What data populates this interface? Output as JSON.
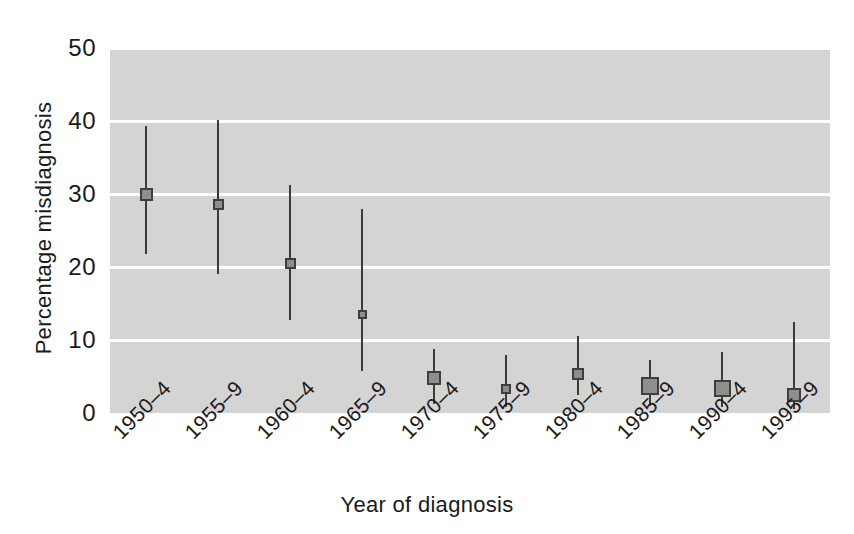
{
  "chart_data": {
    "type": "scatter",
    "title": "",
    "xlabel": "Year of diagnosis",
    "ylabel": "Percentage misdiagnosis",
    "categories": [
      "1950–4",
      "1955–9",
      "1960–4",
      "1965–9",
      "1970–4",
      "1975–9",
      "1980–4",
      "1985–9",
      "1990–4",
      "1995–9"
    ],
    "values": [
      30.0,
      28.5,
      20.5,
      13.5,
      4.8,
      3.3,
      5.3,
      3.7,
      3.3,
      2.5
    ],
    "error_low": [
      21.8,
      19.0,
      12.7,
      5.8,
      1.2,
      0.8,
      2.5,
      1.0,
      0.8,
      0.5
    ],
    "error_high": [
      39.3,
      40.2,
      31.3,
      28.0,
      8.8,
      8.0,
      10.5,
      7.2,
      8.3,
      12.5
    ],
    "marker_sizes": [
      13,
      11,
      11,
      9,
      14,
      10,
      12,
      18,
      17,
      14
    ],
    "ylim": [
      0,
      50
    ],
    "yticks": [
      0,
      10,
      20,
      30,
      40,
      50
    ],
    "ytick_labels": [
      "0",
      "10",
      "20",
      "30",
      "40",
      "50"
    ],
    "gridlines": [
      10,
      20,
      30,
      40,
      50
    ],
    "grid": true,
    "grid_color": "#ffffff",
    "plot_background": "#d4d4d4",
    "marker_fill": "#8e8e8e",
    "marker_edge": "#3e3e3e",
    "whisker_color": "#3b3b3b",
    "legend": null,
    "legend_position": "none",
    "annotations": []
  },
  "axes": {
    "y_title": "Percentage misdiagnosis",
    "x_title": "Year of diagnosis"
  }
}
